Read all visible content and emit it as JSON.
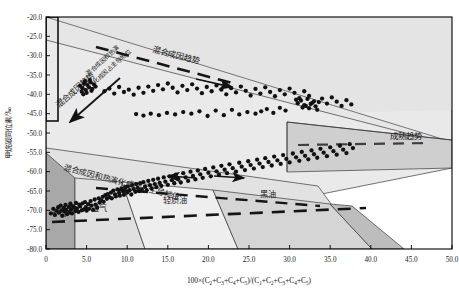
{
  "axes": {
    "x": {
      "label_prefix": "100×(C",
      "label_full": "100×(C2+C3+C4+C5)/(C1+C2+C3+C4+C5)",
      "min": 0,
      "max": 50,
      "ticks": [
        "0",
        "5.0",
        "10.0",
        "15.0",
        "20.0",
        "25.0",
        "30.0",
        "35.0",
        "40.0",
        "45.0",
        "50.0"
      ],
      "tick_values": [
        0,
        5,
        10,
        15,
        20,
        25,
        30,
        35,
        40,
        45,
        50
      ]
    },
    "y": {
      "label": "甲烷碳同位素/‰",
      "min": -80,
      "max": -20,
      "ticks": [
        "-80.0",
        "-75.0",
        "-70.0",
        "-65.0",
        "-60.0",
        "-55.0",
        "-50.0",
        "-45.0",
        "-40.0",
        "-35.0",
        "-30.0",
        "-25.0",
        "-20.0"
      ],
      "tick_values": [
        -80,
        -75,
        -70,
        -65,
        -60,
        -55,
        -50,
        -45,
        -40,
        -35,
        -30,
        -25,
        -20
      ]
    }
  },
  "annotations": {
    "mixed_trend_top": "混合成因趋势",
    "mixed_trend_left": "混合成因趋势",
    "mixed_thermal_diag": "混合成因和热演化成因占主导地位",
    "mixed_thermal_small": "混合成因和热演\n化成因占主导地位",
    "maturity_trend": "成熟趋势",
    "dry_gas": "干气",
    "wet_gas": "湿气",
    "light_oil": "轻质油",
    "black_oil": "黑油"
  },
  "colors": {
    "background": "#ffffff",
    "axis": "#000000",
    "zone_light": "#e8e8e8",
    "zone_mid": "#d3d3d3",
    "zone_dark": "#a9a9a9",
    "zone_darker": "#9a9a9a",
    "zone_pale": "#f0f0f0",
    "point": "#111111",
    "point_gray": "#6e6e6e",
    "dash": "#1a1a1a"
  },
  "chart_data": {
    "type": "scatter",
    "title": "",
    "xlabel": "100×(C2+C3+C4+C5)/(C1+C2+C3+C4+C5)",
    "ylabel": "甲烷碳同位素/‰",
    "xlim": [
      0,
      50
    ],
    "ylim": [
      -80,
      -20
    ],
    "grid": false,
    "legend": "none",
    "series": [
      {
        "name": "样品点",
        "marker": "circle",
        "color": "#111111",
        "points": [
          [
            0.6,
            -70.8
          ],
          [
            0.9,
            -69.6
          ],
          [
            1.1,
            -71.2
          ],
          [
            1.3,
            -70.1
          ],
          [
            1.5,
            -69.2
          ],
          [
            1.6,
            -70.6
          ],
          [
            1.8,
            -68.8
          ],
          [
            1.9,
            -70.0
          ],
          [
            2.0,
            -71.4
          ],
          [
            2.2,
            -69.4
          ],
          [
            2.3,
            -70.3
          ],
          [
            2.4,
            -68.6
          ],
          [
            2.5,
            -69.9
          ],
          [
            2.6,
            -71.0
          ],
          [
            2.8,
            -69.1
          ],
          [
            2.9,
            -70.5
          ],
          [
            3.0,
            -68.3
          ],
          [
            3.1,
            -69.7
          ],
          [
            3.2,
            -70.8
          ],
          [
            3.3,
            -68.9
          ],
          [
            3.5,
            -69.3
          ],
          [
            3.6,
            -70.2
          ],
          [
            3.7,
            -68.1
          ],
          [
            3.8,
            -69.5
          ],
          [
            4.0,
            -70.4
          ],
          [
            4.1,
            -68.5
          ],
          [
            4.2,
            -69.0
          ],
          [
            4.4,
            -70.0
          ],
          [
            4.5,
            -68.2
          ],
          [
            4.6,
            -69.8
          ],
          [
            4.8,
            -67.9
          ],
          [
            4.9,
            -69.2
          ],
          [
            5.0,
            -70.1
          ],
          [
            5.2,
            -68.4
          ],
          [
            5.3,
            -69.6
          ],
          [
            5.5,
            -67.6
          ],
          [
            5.6,
            -68.8
          ],
          [
            5.8,
            -69.9
          ],
          [
            6.0,
            -67.2
          ],
          [
            6.1,
            -68.5
          ],
          [
            6.3,
            -69.3
          ],
          [
            6.5,
            -66.9
          ],
          [
            6.6,
            -68.0
          ],
          [
            6.8,
            -67.4
          ],
          [
            7.0,
            -66.5
          ],
          [
            7.1,
            -67.8
          ],
          [
            7.3,
            -66.1
          ],
          [
            7.5,
            -67.0
          ],
          [
            7.6,
            -65.8
          ],
          [
            7.8,
            -66.6
          ],
          [
            8.0,
            -65.4
          ],
          [
            8.1,
            -66.9
          ],
          [
            8.3,
            -64.9
          ],
          [
            8.5,
            -65.9
          ],
          [
            8.6,
            -66.4
          ],
          [
            8.8,
            -64.6
          ],
          [
            9.0,
            -65.5
          ],
          [
            9.1,
            -66.2
          ],
          [
            9.3,
            -64.3
          ],
          [
            9.5,
            -65.1
          ],
          [
            9.6,
            -66.0
          ],
          [
            9.8,
            -64.0
          ],
          [
            10.0,
            -65.4
          ],
          [
            10.1,
            -63.8
          ],
          [
            10.3,
            -64.8
          ],
          [
            10.5,
            -65.9
          ],
          [
            10.6,
            -63.5
          ],
          [
            10.8,
            -64.5
          ],
          [
            11.0,
            -65.2
          ],
          [
            11.1,
            -63.2
          ],
          [
            11.3,
            -64.2
          ],
          [
            11.5,
            -65.0
          ],
          [
            11.6,
            -63.0
          ],
          [
            11.8,
            -64.6
          ],
          [
            12.0,
            -62.7
          ],
          [
            12.2,
            -63.9
          ],
          [
            12.4,
            -64.8
          ],
          [
            12.6,
            -62.4
          ],
          [
            12.8,
            -63.5
          ],
          [
            13.0,
            -64.3
          ],
          [
            13.2,
            -62.1
          ],
          [
            13.4,
            -63.2
          ],
          [
            13.6,
            -64.0
          ],
          [
            13.8,
            -61.8
          ],
          [
            14.0,
            -62.9
          ],
          [
            14.2,
            -63.7
          ],
          [
            14.5,
            -61.5
          ],
          [
            14.7,
            -62.6
          ],
          [
            15.0,
            -63.4
          ],
          [
            15.2,
            -61.2
          ],
          [
            15.5,
            -62.2
          ],
          [
            15.8,
            -63.0
          ],
          [
            16.0,
            -60.8
          ],
          [
            16.3,
            -61.9
          ],
          [
            16.6,
            -62.8
          ],
          [
            16.9,
            -60.4
          ],
          [
            17.2,
            -61.5
          ],
          [
            17.5,
            -62.4
          ],
          [
            17.8,
            -60.0
          ],
          [
            18.1,
            -61.1
          ],
          [
            18.4,
            -62.0
          ],
          [
            18.7,
            -59.7
          ],
          [
            19.0,
            -60.7
          ],
          [
            19.3,
            -61.6
          ],
          [
            19.6,
            -59.3
          ],
          [
            20.0,
            -60.3
          ],
          [
            20.3,
            -61.2
          ],
          [
            20.6,
            -58.9
          ],
          [
            21.0,
            -59.9
          ],
          [
            21.3,
            -60.8
          ],
          [
            21.6,
            -58.5
          ],
          [
            22.0,
            -59.5
          ],
          [
            22.3,
            -60.4
          ],
          [
            22.6,
            -58.1
          ],
          [
            23.0,
            -59.1
          ],
          [
            23.4,
            -60.0
          ],
          [
            23.8,
            -57.7
          ],
          [
            24.1,
            -58.7
          ],
          [
            24.5,
            -59.6
          ],
          [
            24.9,
            -57.3
          ],
          [
            25.2,
            -58.3
          ],
          [
            25.6,
            -59.2
          ],
          [
            26.0,
            -56.9
          ],
          [
            26.3,
            -57.9
          ],
          [
            26.7,
            -58.8
          ],
          [
            27.0,
            -56.5
          ],
          [
            27.4,
            -57.5
          ],
          [
            27.8,
            -58.4
          ],
          [
            28.1,
            -56.1
          ],
          [
            28.5,
            -57.1
          ],
          [
            28.9,
            -58.0
          ],
          [
            29.2,
            -55.7
          ],
          [
            29.6,
            -56.7
          ],
          [
            30.0,
            -57.6
          ],
          [
            30.4,
            -55.3
          ],
          [
            30.8,
            -56.3
          ],
          [
            31.2,
            -57.2
          ],
          [
            31.5,
            -54.9
          ],
          [
            31.9,
            -55.9
          ],
          [
            32.3,
            -56.8
          ],
          [
            32.7,
            -54.5
          ],
          [
            33.0,
            -55.5
          ],
          [
            33.4,
            -56.4
          ],
          [
            33.8,
            -54.1
          ],
          [
            34.2,
            -55.1
          ],
          [
            34.6,
            -56.0
          ],
          [
            35.0,
            -53.7
          ],
          [
            35.4,
            -54.7
          ],
          [
            35.8,
            -55.6
          ],
          [
            36.2,
            -53.3
          ],
          [
            36.6,
            -54.3
          ],
          [
            37.0,
            -55.2
          ],
          [
            37.4,
            -52.9
          ],
          [
            37.8,
            -53.9
          ],
          [
            4.2,
            -37.8
          ],
          [
            4.5,
            -38.4
          ],
          [
            4.7,
            -37.2
          ],
          [
            4.9,
            -38.9
          ],
          [
            5.1,
            -37.6
          ],
          [
            5.3,
            -38.2
          ],
          [
            5.5,
            -36.9
          ],
          [
            5.7,
            -38.6
          ],
          [
            4.4,
            -39.3
          ],
          [
            4.8,
            -36.6
          ],
          [
            5.0,
            -39.6
          ],
          [
            5.4,
            -36.3
          ],
          [
            5.6,
            -39.1
          ],
          [
            5.9,
            -37.4
          ],
          [
            6.1,
            -38.0
          ],
          [
            4.6,
            -40.0
          ],
          [
            7.2,
            -39.2
          ],
          [
            7.8,
            -38.5
          ],
          [
            8.4,
            -39.8
          ],
          [
            9.0,
            -38.1
          ],
          [
            9.6,
            -39.4
          ],
          [
            10.2,
            -38.8
          ],
          [
            10.8,
            -40.1
          ],
          [
            11.4,
            -38.3
          ],
          [
            12.0,
            -39.6
          ],
          [
            12.6,
            -38.0
          ],
          [
            13.2,
            -39.1
          ],
          [
            13.8,
            -37.6
          ],
          [
            14.4,
            -38.7
          ],
          [
            15.0,
            -37.2
          ],
          [
            15.6,
            -38.3
          ],
          [
            16.2,
            -39.5
          ],
          [
            16.8,
            -37.8
          ],
          [
            17.4,
            -38.9
          ],
          [
            18.0,
            -37.4
          ],
          [
            18.6,
            -38.5
          ],
          [
            19.2,
            -39.7
          ],
          [
            19.8,
            -38.1
          ],
          [
            20.4,
            -39.2
          ],
          [
            21.0,
            -37.7
          ],
          [
            21.6,
            -38.8
          ],
          [
            22.2,
            -40.0
          ],
          [
            22.8,
            -38.4
          ],
          [
            23.4,
            -39.5
          ],
          [
            24.0,
            -38.0
          ],
          [
            24.6,
            -39.1
          ],
          [
            25.2,
            -40.3
          ],
          [
            25.8,
            -38.6
          ],
          [
            26.4,
            -39.8
          ],
          [
            27.0,
            -38.2
          ],
          [
            27.6,
            -39.4
          ],
          [
            28.2,
            -40.5
          ],
          [
            28.8,
            -38.9
          ],
          [
            29.4,
            -40.0
          ],
          [
            30.0,
            -38.5
          ],
          [
            30.6,
            -39.6
          ],
          [
            31.2,
            -41.0
          ],
          [
            31.8,
            -39.2
          ],
          [
            32.4,
            -40.4
          ],
          [
            31.0,
            -42.3
          ],
          [
            31.4,
            -41.6
          ],
          [
            31.8,
            -42.8
          ],
          [
            32.2,
            -41.2
          ],
          [
            32.6,
            -42.5
          ],
          [
            33.0,
            -41.8
          ],
          [
            31.6,
            -43.4
          ],
          [
            32.0,
            -43.0
          ],
          [
            32.4,
            -43.6
          ],
          [
            32.8,
            -42.2
          ],
          [
            33.2,
            -43.1
          ],
          [
            30.8,
            -41.4
          ],
          [
            33.6,
            -42.0
          ],
          [
            33.4,
            -44.0
          ],
          [
            34.0,
            -41.1
          ],
          [
            34.6,
            -42.4
          ],
          [
            35.2,
            -40.8
          ],
          [
            35.8,
            -41.9
          ],
          [
            36.4,
            -43.0
          ],
          [
            37.0,
            -41.5
          ],
          [
            37.6,
            -42.6
          ],
          [
            26.5,
            -44.4
          ],
          [
            27.2,
            -43.8
          ],
          [
            28.0,
            -44.8
          ],
          [
            28.8,
            -43.5
          ],
          [
            29.5,
            -44.2
          ],
          [
            25.8,
            -45.0
          ],
          [
            24.8,
            -44.6
          ],
          [
            23.8,
            -45.2
          ],
          [
            22.9,
            -44.0
          ],
          [
            21.9,
            -45.4
          ],
          [
            20.9,
            -44.2
          ],
          [
            19.9,
            -45.6
          ],
          [
            18.9,
            -44.4
          ],
          [
            17.9,
            -45.0
          ],
          [
            16.9,
            -44.6
          ],
          [
            15.9,
            -45.2
          ],
          [
            14.9,
            -44.8
          ],
          [
            13.9,
            -45.4
          ],
          [
            12.9,
            -45.0
          ],
          [
            12.0,
            -45.5
          ],
          [
            11.1,
            -45.1
          ]
        ]
      }
    ],
    "reference_lines": [
      {
        "name": "mixed-genesis-trend-top",
        "style": "dashed",
        "from": [
          6.2,
          -74.0
        ],
        "to": [
          23.5,
          -64.5
        ]
      },
      {
        "name": "mixed-genesis-trend-left",
        "style": "solid-arrow",
        "from": [
          9.0,
          -66.5
        ],
        "to": [
          2.5,
          -55.5
        ]
      },
      {
        "name": "maturity-trend",
        "style": "dashed",
        "from": [
          26.0,
          -52.0
        ],
        "to": [
          47.0,
          -50.5
        ]
      },
      {
        "name": "lower-dashed-upper",
        "style": "dashed",
        "from": [
          6.5,
          -39.5
        ],
        "to": [
          30.0,
          -35.0
        ]
      },
      {
        "name": "lower-dashed-base",
        "style": "dashed",
        "from": [
          1.0,
          -28.5
        ],
        "to": [
          40.0,
          -35.5
        ]
      }
    ],
    "zones": [
      {
        "name": "干气",
        "label": "dry-gas"
      },
      {
        "name": "湿气",
        "label": "wet-gas"
      },
      {
        "name": "轻质油",
        "label": "light-oil"
      },
      {
        "name": "黑油",
        "label": "black-oil"
      }
    ]
  }
}
